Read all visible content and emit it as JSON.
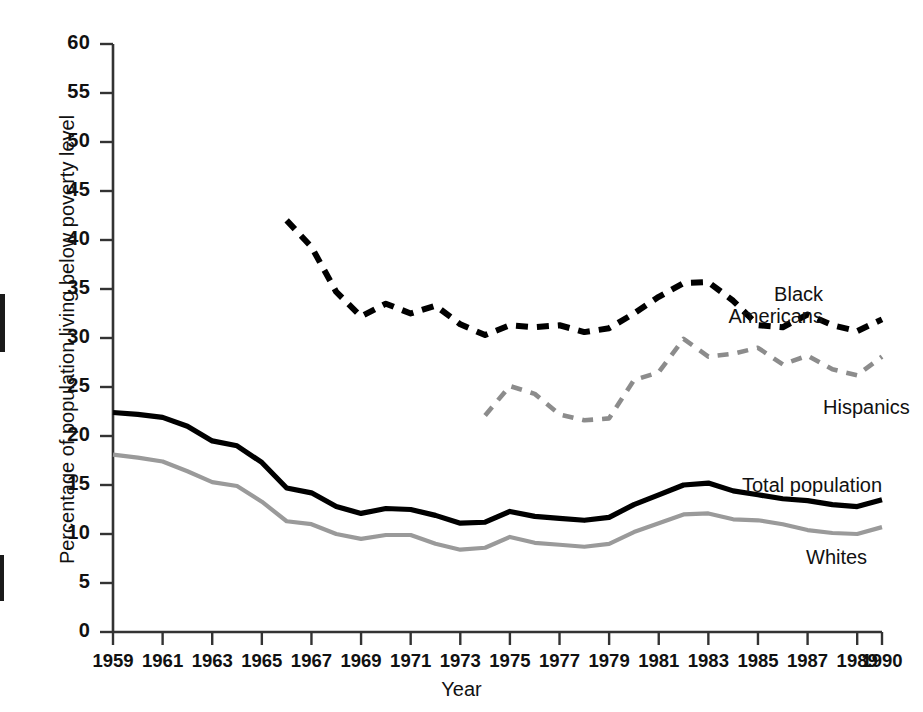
{
  "chart_data": {
    "type": "line",
    "title": "",
    "xlabel": "Year",
    "ylabel": "Percentage of population living below poverty level",
    "xlim": [
      1959,
      1990
    ],
    "ylim": [
      0,
      60
    ],
    "ytick_step": 5,
    "grid": false,
    "legend_position": "inline-right",
    "x_tick_labels": [
      "1959",
      "1961",
      "1963",
      "1965",
      "1967",
      "1969",
      "1971",
      "1973",
      "1975",
      "1977",
      "1979",
      "1981",
      "1983",
      "1985",
      "1987",
      "1989",
      "1990"
    ],
    "x_tick_values": [
      1959,
      1961,
      1963,
      1965,
      1967,
      1969,
      1971,
      1973,
      1975,
      1977,
      1979,
      1981,
      1983,
      1985,
      1987,
      1989,
      1990
    ],
    "y_tick_labels": [
      "0",
      "5",
      "10",
      "15",
      "20",
      "25",
      "30",
      "35",
      "40",
      "45",
      "50",
      "55",
      "60"
    ],
    "y_tick_values": [
      0,
      5,
      10,
      15,
      20,
      25,
      30,
      35,
      40,
      45,
      50,
      55,
      60
    ],
    "series": [
      {
        "name": "Black Americans",
        "style": "dashed",
        "color": "#000000",
        "x": [
          1966,
          1967,
          1968,
          1969,
          1970,
          1971,
          1972,
          1973,
          1974,
          1975,
          1976,
          1977,
          1978,
          1979,
          1980,
          1981,
          1982,
          1983,
          1984,
          1985,
          1986,
          1987,
          1988,
          1989,
          1990
        ],
        "values": [
          42.0,
          39.3,
          34.7,
          32.2,
          33.5,
          32.5,
          33.3,
          31.4,
          30.3,
          31.3,
          31.1,
          31.3,
          30.6,
          31.0,
          32.5,
          34.2,
          35.6,
          35.7,
          33.8,
          31.3,
          31.1,
          32.4,
          31.3,
          30.7,
          31.9
        ]
      },
      {
        "name": "Hispanics",
        "style": "dashed",
        "color": "#8c8c8c",
        "x": [
          1974,
          1975,
          1976,
          1977,
          1978,
          1979,
          1980,
          1981,
          1982,
          1983,
          1984,
          1985,
          1986,
          1987,
          1988,
          1989,
          1990
        ],
        "values": [
          22.1,
          25.1,
          24.3,
          22.2,
          21.6,
          21.8,
          25.7,
          26.5,
          29.9,
          28.1,
          28.4,
          29.0,
          27.3,
          28.2,
          26.8,
          26.2,
          28.1
        ]
      },
      {
        "name": "Total population",
        "style": "solid",
        "color": "#000000",
        "x": [
          1959,
          1960,
          1961,
          1962,
          1963,
          1964,
          1965,
          1966,
          1967,
          1968,
          1969,
          1970,
          1971,
          1972,
          1973,
          1974,
          1975,
          1976,
          1977,
          1978,
          1979,
          1980,
          1981,
          1982,
          1983,
          1984,
          1985,
          1986,
          1987,
          1988,
          1989,
          1990
        ],
        "values": [
          22.4,
          22.2,
          21.9,
          21.0,
          19.5,
          19.0,
          17.3,
          14.7,
          14.2,
          12.8,
          12.1,
          12.6,
          12.5,
          11.9,
          11.1,
          11.2,
          12.3,
          11.8,
          11.6,
          11.4,
          11.7,
          13.0,
          14.0,
          15.0,
          15.2,
          14.4,
          14.0,
          13.6,
          13.4,
          13.0,
          12.8,
          13.5
        ]
      },
      {
        "name": "Whites",
        "style": "solid",
        "color": "#9a9a9a",
        "x": [
          1959,
          1960,
          1961,
          1962,
          1963,
          1964,
          1965,
          1966,
          1967,
          1968,
          1969,
          1970,
          1971,
          1972,
          1973,
          1974,
          1975,
          1976,
          1977,
          1978,
          1979,
          1980,
          1981,
          1982,
          1983,
          1984,
          1985,
          1986,
          1987,
          1988,
          1989,
          1990
        ],
        "values": [
          18.1,
          17.8,
          17.4,
          16.4,
          15.3,
          14.9,
          13.3,
          11.3,
          11.0,
          10.0,
          9.5,
          9.9,
          9.9,
          9.0,
          8.4,
          8.6,
          9.7,
          9.1,
          8.9,
          8.7,
          9.0,
          10.2,
          11.1,
          12.0,
          12.1,
          11.5,
          11.4,
          11.0,
          10.4,
          10.1,
          10.0,
          10.7
        ]
      }
    ]
  },
  "axes": {
    "x_title": "Year",
    "y_title": "Percentage of population living below poverty level"
  },
  "labels": {
    "black_americans_line1": "Black",
    "black_americans_line2": "Americans",
    "hispanics": "Hispanics",
    "total_population": "Total population",
    "whites": "Whites"
  },
  "colors": {
    "axis": "#333333",
    "black_series": "#000000",
    "gray_series": "#9a9a9a",
    "hispanic_series": "#8c8c8c",
    "text": "#111111",
    "background": "#ffffff"
  },
  "caption": ""
}
